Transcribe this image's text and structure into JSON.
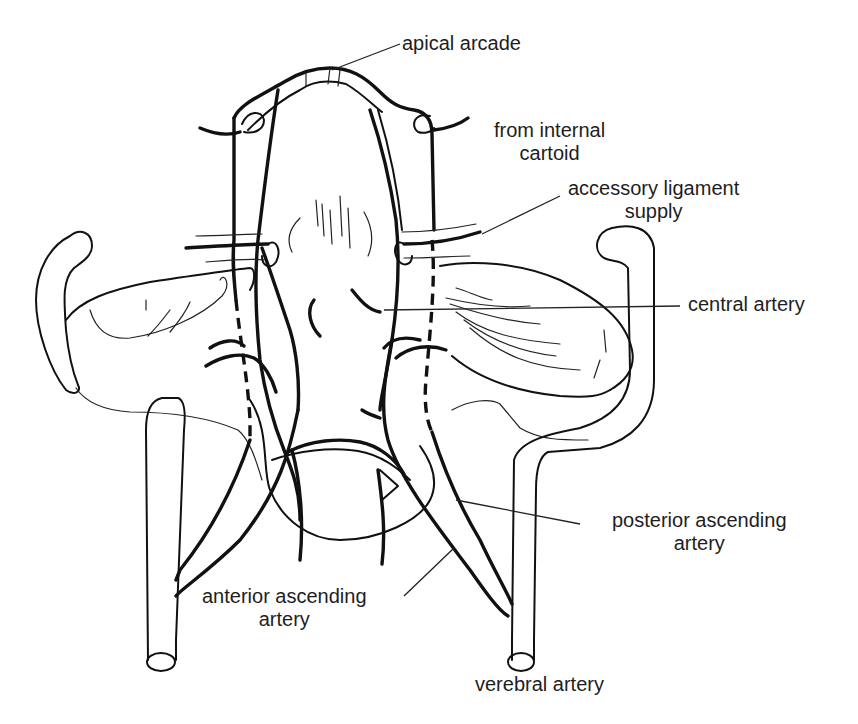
{
  "diagram": {
    "labels": {
      "apical_arcade": "apical arcade",
      "from_internal_cartoid": [
        "from internal",
        "cartoid"
      ],
      "accessory_ligament_supply": [
        "accessory ligament",
        "supply"
      ],
      "central_artery": "central artery",
      "posterior_ascending_artery": [
        "posterior ascending",
        "artery"
      ],
      "anterior_ascending_artery": [
        "anterior ascending",
        "artery"
      ],
      "verebral_artery": "verebral artery"
    },
    "colors": {
      "background": "#ffffff",
      "line": "#111111",
      "text": "#1e1e1e"
    }
  }
}
